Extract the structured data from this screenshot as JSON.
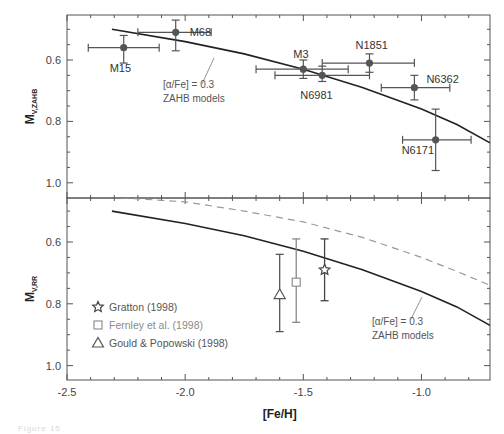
{
  "chart_data": [
    {
      "type": "scatter",
      "panel": "top",
      "title": "",
      "xlabel": "[Fe/H]",
      "ylabel": "M_V,ZAHB",
      "ylabel_main": "M",
      "ylabel_sub": "V,ZAHB",
      "xlim": [
        -2.5,
        -0.71
      ],
      "ylim": [
        1.05,
        0.453
      ],
      "y_inverted": true,
      "grid": false,
      "yticks": [
        0.6,
        0.8,
        1.0
      ],
      "ytick_labels": [
        "0.6",
        "0.8",
        "1.0"
      ],
      "series": [
        {
          "name": "Globular clusters",
          "marker": "filled-circle",
          "color": "#555555",
          "points": [
            {
              "label": "M15",
              "x": -2.26,
              "y": 0.56,
              "xerr": [
                -2.41,
                -2.11
              ],
              "yerr": [
                0.52,
                0.61
              ]
            },
            {
              "label": "M68",
              "x": -2.04,
              "y": 0.51,
              "xerr": [
                -2.2,
                -1.89
              ],
              "yerr": [
                0.47,
                0.57
              ]
            },
            {
              "label": "M3",
              "x": -1.5,
              "y": 0.63,
              "xerr": [
                -1.7,
                -1.31
              ],
              "yerr": [
                0.6,
                0.66
              ]
            },
            {
              "label": "N6981",
              "x": -1.42,
              "y": 0.65,
              "xerr": [
                -1.62,
                -1.22
              ],
              "yerr": [
                0.62,
                0.67
              ]
            },
            {
              "label": "N1851",
              "x": -1.22,
              "y": 0.61,
              "xerr": [
                -1.42,
                -1.03
              ],
              "yerr": [
                0.58,
                0.64
              ]
            },
            {
              "label": "N6362",
              "x": -1.03,
              "y": 0.69,
              "xerr": [
                -1.17,
                -0.88
              ],
              "yerr": [
                0.65,
                0.73
              ]
            },
            {
              "label": "N6171",
              "x": -0.94,
              "y": 0.86,
              "xerr": [
                -1.08,
                -0.79
              ],
              "yerr": [
                0.76,
                0.96
              ]
            }
          ]
        },
        {
          "name": "[α/Fe] = 0.3 ZAHB models",
          "type": "line",
          "style": "solid",
          "color": "#222222",
          "x": [
            -2.31,
            -2.0,
            -1.75,
            -1.5,
            -1.25,
            -1.0,
            -0.85,
            -0.71
          ],
          "y": [
            0.5,
            0.54,
            0.58,
            0.63,
            0.69,
            0.76,
            0.81,
            0.87
          ]
        }
      ],
      "annotation": {
        "line1": "[α/Fe] = 0.3",
        "line2": "ZAHB models"
      }
    },
    {
      "type": "scatter",
      "panel": "bottom",
      "title": "",
      "xlabel": "[Fe/H]",
      "ylabel": "M_V,RR",
      "ylabel_main": "M",
      "ylabel_sub": "V,RR",
      "xlim": [
        -2.5,
        -0.71
      ],
      "ylim": [
        1.045,
        0.457
      ],
      "y_inverted": true,
      "grid": false,
      "xticks": [
        -2.5,
        -2.0,
        -1.5,
        -1.0
      ],
      "xtick_labels": [
        "-2.5",
        "-2.0",
        "-1.5",
        "-1.0"
      ],
      "yticks": [
        0.6,
        0.8,
        1.0
      ],
      "ytick_labels": [
        "0.6",
        "0.8",
        "1.0"
      ],
      "series": [
        {
          "name": "Gratton (1998)",
          "marker": "star",
          "color": "#444444",
          "x": -1.41,
          "y": 0.69,
          "yerr": [
            0.59,
            0.79
          ]
        },
        {
          "name": "Fernley et al. (1998)",
          "marker": "square",
          "color": "#888888",
          "x": -1.53,
          "y": 0.73,
          "yerr": [
            0.59,
            0.86
          ]
        },
        {
          "name": "Gould & Popowski (1998)",
          "marker": "triangle",
          "color": "#555555",
          "x": -1.6,
          "y": 0.77,
          "yerr": [
            0.64,
            0.89
          ]
        },
        {
          "name": "[α/Fe] = 0.3 ZAHB models",
          "type": "line",
          "style": "solid",
          "color": "#222222",
          "x": [
            -2.31,
            -2.0,
            -1.75,
            -1.5,
            -1.25,
            -1.0,
            -0.85,
            -0.71
          ],
          "y": [
            0.5,
            0.54,
            0.58,
            0.63,
            0.69,
            0.76,
            0.81,
            0.87
          ]
        },
        {
          "name": "shifted model (dashed)",
          "type": "line",
          "style": "dashed",
          "color": "#999999",
          "x": [
            -2.27,
            -2.0,
            -1.75,
            -1.5,
            -1.25,
            -1.0,
            -0.85,
            -0.71
          ],
          "y": [
            0.457,
            0.47,
            0.5,
            0.535,
            0.585,
            0.65,
            0.695,
            0.74
          ]
        }
      ],
      "legend": {
        "position": "lower-left",
        "entries": [
          {
            "label": "Gratton (1998)",
            "marker": "star"
          },
          {
            "label": "Fernley et al. (1998)",
            "marker": "square"
          },
          {
            "label": "Gould & Popowski (1998)",
            "marker": "triangle"
          }
        ]
      },
      "annotation": {
        "line1": "[α/Fe] = 0.3",
        "line2": "ZAHB models"
      }
    }
  ],
  "figure": {
    "xlabel": "[Fe/H]",
    "caption_fragment": "Figure 15"
  }
}
